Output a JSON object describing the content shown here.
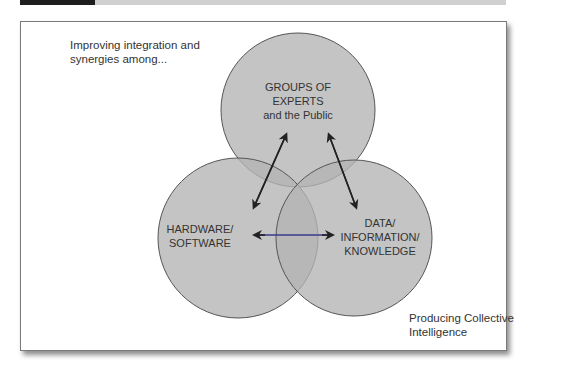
{
  "intro_text": {
    "line1": "Improving integration and",
    "line2": "synergies among..."
  },
  "outcome_text": {
    "line1": "Producing Collective",
    "line2": "Intelligence"
  },
  "circles": [
    {
      "id": "experts",
      "lines": [
        "GROUPS OF",
        "EXPERTS",
        "and the Public"
      ]
    },
    {
      "id": "hardware",
      "lines": [
        "HARDWARE/",
        "SOFTWARE"
      ]
    },
    {
      "id": "data",
      "lines": [
        "DATA/",
        "INFORMATION/",
        "KNOWLEDGE"
      ]
    }
  ],
  "colors": {
    "circle_fill": "#b4b4b4",
    "circle_stroke": "#555555",
    "arrow": "#222222",
    "horizontal_arrow_line": "#3a3a8a"
  }
}
